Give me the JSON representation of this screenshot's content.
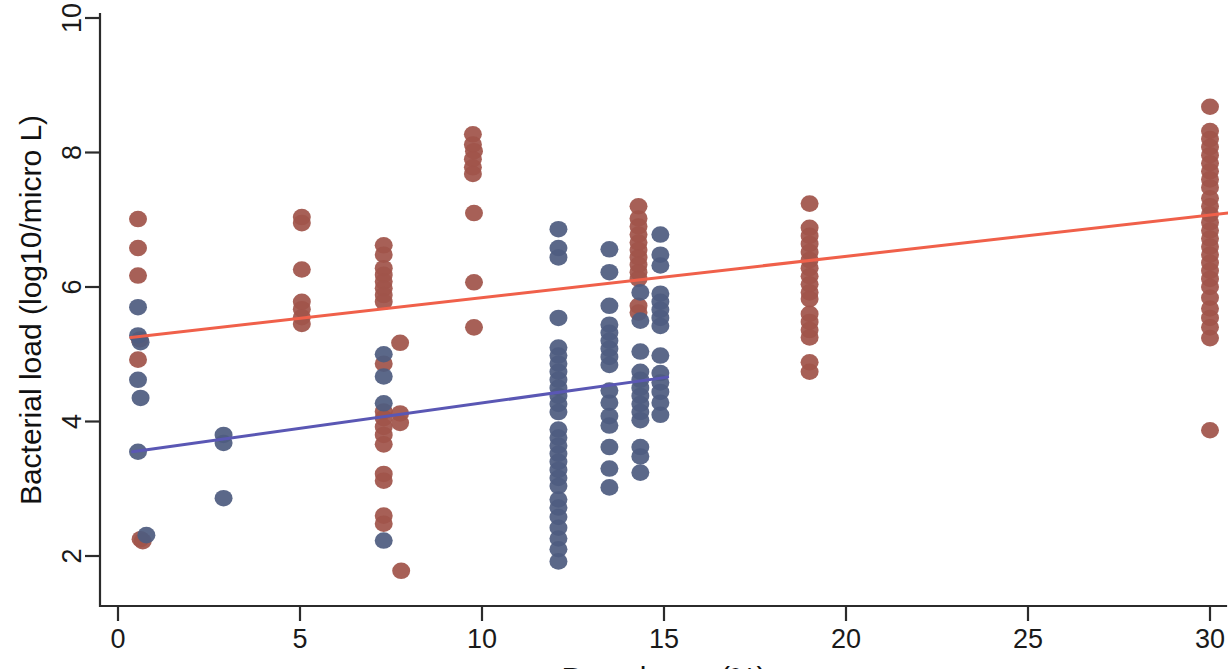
{
  "chart_data": {
    "type": "scatter",
    "title": "",
    "xlabel": "Prevalence (%)",
    "ylabel": "Bacterial load  (log10/micro L)",
    "xlim": [
      -0.3,
      30.8
    ],
    "ylim": [
      1.45,
      10.35
    ],
    "xticks": [
      0,
      5,
      10,
      15,
      20,
      25,
      30
    ],
    "xticklabels": [
      "0",
      "5",
      "10",
      "15",
      "20",
      "25",
      "30"
    ],
    "yticks": [
      2,
      4,
      6,
      8,
      10
    ],
    "yticklabels": [
      "2",
      "4",
      "6",
      "8",
      "10"
    ],
    "grid": false,
    "legend": "none",
    "colors": {
      "series_red": "#a0544a",
      "series_blue": "#4f5c80",
      "fit_red": "#f0604a",
      "fit_blue": "#5a57b4",
      "axis": "#2b2b2b"
    },
    "marker_radius_px": 9,
    "series": [
      {
        "name": "Red group",
        "color": "#a0544a",
        "points": [
          [
            0.55,
            7.01
          ],
          [
            0.55,
            6.58
          ],
          [
            0.55,
            6.17
          ],
          [
            0.6,
            5.22
          ],
          [
            0.55,
            4.92
          ],
          [
            0.62,
            2.25
          ],
          [
            0.68,
            2.22
          ],
          [
            5.05,
            7.04
          ],
          [
            5.05,
            6.95
          ],
          [
            5.05,
            6.26
          ],
          [
            5.05,
            5.78
          ],
          [
            5.05,
            5.67
          ],
          [
            5.05,
            5.55
          ],
          [
            5.05,
            5.45
          ],
          [
            7.3,
            6.62
          ],
          [
            7.3,
            6.48
          ],
          [
            7.3,
            6.28
          ],
          [
            7.3,
            6.18
          ],
          [
            7.3,
            6.08
          ],
          [
            7.3,
            5.98
          ],
          [
            7.3,
            5.88
          ],
          [
            7.3,
            5.78
          ],
          [
            7.3,
            4.86
          ],
          [
            7.3,
            4.15
          ],
          [
            7.3,
            4.05
          ],
          [
            7.3,
            3.92
          ],
          [
            7.3,
            3.8
          ],
          [
            7.3,
            3.66
          ],
          [
            7.3,
            3.22
          ],
          [
            7.3,
            3.12
          ],
          [
            7.3,
            2.6
          ],
          [
            7.3,
            2.48
          ],
          [
            7.75,
            5.17
          ],
          [
            7.75,
            4.12
          ],
          [
            7.75,
            3.98
          ],
          [
            7.78,
            1.78
          ],
          [
            9.75,
            8.27
          ],
          [
            9.75,
            8.12
          ],
          [
            9.78,
            8.02
          ],
          [
            9.75,
            7.9
          ],
          [
            9.75,
            7.78
          ],
          [
            9.75,
            7.68
          ],
          [
            9.78,
            7.1
          ],
          [
            9.78,
            6.07
          ],
          [
            9.78,
            5.4
          ],
          [
            14.3,
            7.2
          ],
          [
            14.3,
            7.02
          ],
          [
            14.3,
            6.9
          ],
          [
            14.3,
            6.78
          ],
          [
            14.3,
            6.66
          ],
          [
            14.3,
            6.55
          ],
          [
            14.3,
            6.44
          ],
          [
            14.3,
            6.33
          ],
          [
            14.3,
            6.22
          ],
          [
            14.3,
            6.12
          ],
          [
            14.3,
            5.72
          ],
          [
            14.3,
            5.62
          ],
          [
            19.0,
            7.24
          ],
          [
            19.0,
            6.88
          ],
          [
            19.0,
            6.76
          ],
          [
            19.0,
            6.64
          ],
          [
            19.0,
            6.52
          ],
          [
            19.0,
            6.4
          ],
          [
            19.0,
            6.28
          ],
          [
            19.0,
            6.16
          ],
          [
            19.0,
            6.04
          ],
          [
            19.0,
            5.92
          ],
          [
            19.0,
            5.82
          ],
          [
            19.0,
            5.6
          ],
          [
            19.0,
            5.48
          ],
          [
            19.0,
            5.36
          ],
          [
            19.0,
            5.25
          ],
          [
            19.0,
            4.88
          ],
          [
            19.0,
            4.74
          ],
          [
            30.0,
            8.68
          ],
          [
            30.0,
            8.32
          ],
          [
            30.0,
            8.2
          ],
          [
            30.0,
            8.08
          ],
          [
            30.0,
            7.96
          ],
          [
            30.0,
            7.84
          ],
          [
            30.0,
            7.72
          ],
          [
            30.0,
            7.6
          ],
          [
            30.0,
            7.48
          ],
          [
            30.0,
            7.32
          ],
          [
            30.0,
            7.2
          ],
          [
            30.0,
            7.08
          ],
          [
            30.0,
            6.96
          ],
          [
            30.0,
            6.84
          ],
          [
            30.0,
            6.72
          ],
          [
            30.0,
            6.6
          ],
          [
            30.0,
            6.48
          ],
          [
            30.0,
            6.36
          ],
          [
            30.0,
            6.24
          ],
          [
            30.0,
            6.12
          ],
          [
            30.0,
            6.0
          ],
          [
            30.0,
            5.84
          ],
          [
            30.0,
            5.68
          ],
          [
            30.0,
            5.54
          ],
          [
            30.0,
            5.4
          ],
          [
            30.0,
            5.24
          ],
          [
            30.0,
            3.87
          ]
        ]
      },
      {
        "name": "Blue group",
        "color": "#4f5c80",
        "points": [
          [
            0.55,
            5.7
          ],
          [
            0.55,
            5.28
          ],
          [
            0.62,
            5.18
          ],
          [
            0.55,
            4.62
          ],
          [
            0.62,
            4.35
          ],
          [
            0.55,
            3.55
          ],
          [
            0.78,
            2.31
          ],
          [
            2.9,
            3.8
          ],
          [
            2.9,
            3.68
          ],
          [
            2.9,
            2.86
          ],
          [
            7.3,
            5.0
          ],
          [
            7.3,
            4.67
          ],
          [
            7.3,
            4.27
          ],
          [
            7.3,
            2.23
          ],
          [
            12.1,
            6.86
          ],
          [
            12.1,
            6.58
          ],
          [
            12.1,
            6.44
          ],
          [
            12.1,
            5.54
          ],
          [
            12.1,
            5.1
          ],
          [
            12.1,
            4.98
          ],
          [
            12.1,
            4.86
          ],
          [
            12.1,
            4.74
          ],
          [
            12.1,
            4.62
          ],
          [
            12.1,
            4.5
          ],
          [
            12.1,
            4.38
          ],
          [
            12.1,
            4.26
          ],
          [
            12.1,
            4.14
          ],
          [
            12.1,
            3.88
          ],
          [
            12.1,
            3.76
          ],
          [
            12.1,
            3.64
          ],
          [
            12.1,
            3.52
          ],
          [
            12.1,
            3.4
          ],
          [
            12.1,
            3.28
          ],
          [
            12.1,
            3.16
          ],
          [
            12.1,
            3.04
          ],
          [
            12.1,
            2.84
          ],
          [
            12.1,
            2.72
          ],
          [
            12.1,
            2.58
          ],
          [
            12.1,
            2.42
          ],
          [
            12.1,
            2.26
          ],
          [
            12.1,
            2.1
          ],
          [
            12.1,
            1.92
          ],
          [
            13.5,
            6.56
          ],
          [
            13.5,
            6.22
          ],
          [
            13.5,
            5.72
          ],
          [
            13.5,
            5.44
          ],
          [
            13.5,
            5.32
          ],
          [
            13.5,
            5.2
          ],
          [
            13.5,
            5.08
          ],
          [
            13.5,
            4.96
          ],
          [
            13.5,
            4.84
          ],
          [
            13.5,
            4.46
          ],
          [
            13.5,
            4.28
          ],
          [
            13.5,
            4.08
          ],
          [
            13.5,
            3.94
          ],
          [
            13.5,
            3.62
          ],
          [
            13.5,
            3.3
          ],
          [
            13.5,
            3.02
          ],
          [
            14.35,
            5.92
          ],
          [
            14.35,
            5.5
          ],
          [
            14.35,
            5.04
          ],
          [
            14.35,
            4.74
          ],
          [
            14.35,
            4.62
          ],
          [
            14.35,
            4.5
          ],
          [
            14.35,
            4.38
          ],
          [
            14.35,
            4.26
          ],
          [
            14.35,
            4.14
          ],
          [
            14.35,
            4.02
          ],
          [
            14.35,
            3.62
          ],
          [
            14.35,
            3.48
          ],
          [
            14.35,
            3.24
          ],
          [
            14.9,
            6.78
          ],
          [
            14.9,
            6.48
          ],
          [
            14.9,
            6.32
          ],
          [
            14.9,
            5.9
          ],
          [
            14.9,
            5.78
          ],
          [
            14.9,
            5.66
          ],
          [
            14.9,
            5.54
          ],
          [
            14.9,
            5.42
          ],
          [
            14.9,
            4.98
          ],
          [
            14.9,
            4.72
          ],
          [
            14.9,
            4.58
          ],
          [
            14.9,
            4.44
          ],
          [
            14.9,
            4.28
          ],
          [
            14.9,
            4.1
          ]
        ]
      }
    ],
    "fit_lines": [
      {
        "name": "Red regression",
        "color": "#f0604a",
        "x0": 0.35,
        "y0": 5.25,
        "x1": 30.5,
        "y1": 7.1
      },
      {
        "name": "Blue regression",
        "color": "#5a57b4",
        "x0": 0.4,
        "y0": 3.55,
        "x1": 15.1,
        "y1": 4.66
      }
    ]
  }
}
